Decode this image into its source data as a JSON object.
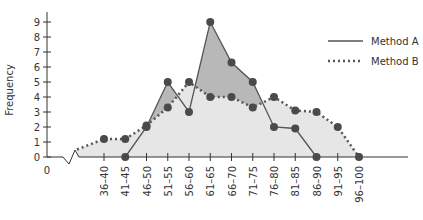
{
  "chart_data": {
    "type": "line",
    "title": "",
    "xlabel": "",
    "ylabel": "Frequency",
    "ylim": [
      0,
      9
    ],
    "yticks": [
      0,
      1,
      2,
      3,
      4,
      5,
      6,
      7,
      8,
      9
    ],
    "x_origin_label": "0",
    "axis_break": true,
    "grid": false,
    "legend_position": "top-right",
    "categories": [
      "36–40",
      "41–45",
      "46–50",
      "51–55",
      "56–60",
      "61–65",
      "66–70",
      "71–75",
      "76–80",
      "81–85",
      "86–90",
      "91–95",
      "96–100"
    ],
    "series": [
      {
        "name": "Method A",
        "style": "solid",
        "values": [
          null,
          0,
          2,
          5,
          3,
          9,
          6.3,
          5,
          2,
          1.9,
          0,
          null,
          null
        ]
      },
      {
        "name": "Method B",
        "style": "dotted",
        "start_value": 0.5,
        "values": [
          1.2,
          1.2,
          2.1,
          3.3,
          5,
          4,
          4,
          3.3,
          4,
          3.1,
          3,
          2,
          0
        ]
      }
    ],
    "fill_between": {
      "A_above_B_color": "#b8b8b8",
      "B_above_A_color": "#e6e6e6"
    },
    "colors": {
      "line": "#555555",
      "marker": "#4a4a4a",
      "axis": "#333333"
    }
  }
}
